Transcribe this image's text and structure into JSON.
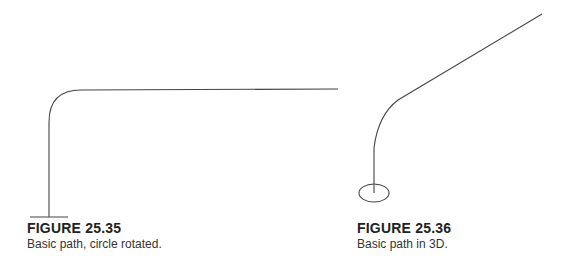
{
  "figures": [
    {
      "title": "FIGURE 25.35",
      "description": "Basic path, circle rotated.",
      "stroke_color": "#444444"
    },
    {
      "title": "FIGURE 25.36",
      "description": "Basic path in 3D.",
      "stroke_color": "#444444"
    }
  ]
}
